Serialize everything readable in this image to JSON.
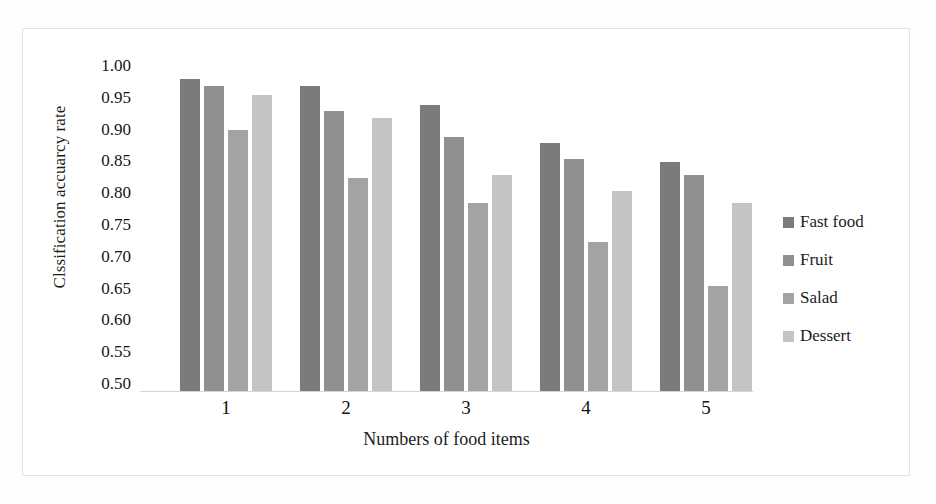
{
  "chart_data": {
    "type": "bar",
    "title": "",
    "xlabel": "Numbers of  food items",
    "ylabel": "Clssification accuarcy rate",
    "categories": [
      "1",
      "2",
      "3",
      "4",
      "5"
    ],
    "ylim": [
      0.5,
      1.0
    ],
    "ytick_step": 0.05,
    "yticks": [
      "1.00",
      "0.95",
      "0.90",
      "0.85",
      "0.80",
      "0.75",
      "0.70",
      "0.65",
      "0.60",
      "0.55",
      "0.50"
    ],
    "ytick_values": [
      1.0,
      0.95,
      0.9,
      0.85,
      0.8,
      0.75,
      0.7,
      0.65,
      0.6,
      0.55,
      0.5
    ],
    "grid": false,
    "legend_position": "right",
    "series": [
      {
        "name": "Fast food",
        "color": "#7b7b7b",
        "values": [
          0.99,
          0.98,
          0.95,
          0.89,
          0.86
        ]
      },
      {
        "name": "Fruit",
        "color": "#909090",
        "values": [
          0.98,
          0.94,
          0.9,
          0.865,
          0.84
        ]
      },
      {
        "name": "Salad",
        "color": "#a3a3a3",
        "values": [
          0.91,
          0.835,
          0.795,
          0.735,
          0.665
        ]
      },
      {
        "name": "Dessert",
        "color": "#c4c4c4",
        "values": [
          0.965,
          0.93,
          0.84,
          0.815,
          0.795
        ]
      }
    ]
  },
  "legend": {
    "items": [
      {
        "label": "Fast food",
        "color": "#7b7b7b"
      },
      {
        "label": "Fruit",
        "color": "#909090"
      },
      {
        "label": "Salad",
        "color": "#a3a3a3"
      },
      {
        "label": "Dessert",
        "color": "#c4c4c4"
      }
    ]
  }
}
